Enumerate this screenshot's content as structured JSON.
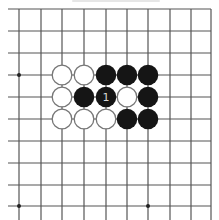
{
  "board": {
    "background": "#ffffff",
    "line_color": "#555555",
    "columns_x": [
      19,
      41,
      62,
      84,
      106,
      127,
      148,
      170,
      191,
      211
    ],
    "rows_y": [
      9,
      31,
      53,
      75,
      97,
      119,
      141,
      163,
      185,
      206
    ],
    "left_extent": 8,
    "bottom_extent": 220,
    "star_points": [
      {
        "col": 0,
        "row": 3
      },
      {
        "col": 0,
        "row": 9
      },
      {
        "col": 6,
        "row": 9
      }
    ]
  },
  "stones": [
    {
      "col": 2,
      "row": 3,
      "color": "white"
    },
    {
      "col": 3,
      "row": 3,
      "color": "white"
    },
    {
      "col": 4,
      "row": 3,
      "color": "black"
    },
    {
      "col": 5,
      "row": 3,
      "color": "black"
    },
    {
      "col": 6,
      "row": 3,
      "color": "black"
    },
    {
      "col": 2,
      "row": 4,
      "color": "white"
    },
    {
      "col": 3,
      "row": 4,
      "color": "black"
    },
    {
      "col": 4,
      "row": 4,
      "color": "black",
      "label": "1"
    },
    {
      "col": 5,
      "row": 4,
      "color": "white"
    },
    {
      "col": 6,
      "row": 4,
      "color": "black"
    },
    {
      "col": 2,
      "row": 5,
      "color": "white"
    },
    {
      "col": 3,
      "row": 5,
      "color": "white"
    },
    {
      "col": 4,
      "row": 5,
      "color": "white"
    },
    {
      "col": 5,
      "row": 5,
      "color": "black"
    },
    {
      "col": 6,
      "row": 5,
      "color": "black"
    }
  ],
  "colors": {
    "black_stone": "#151515",
    "white_stone_fill": "#ffffff",
    "white_stone_stroke": "#777777",
    "label_on_black": "#d8d8d8"
  }
}
